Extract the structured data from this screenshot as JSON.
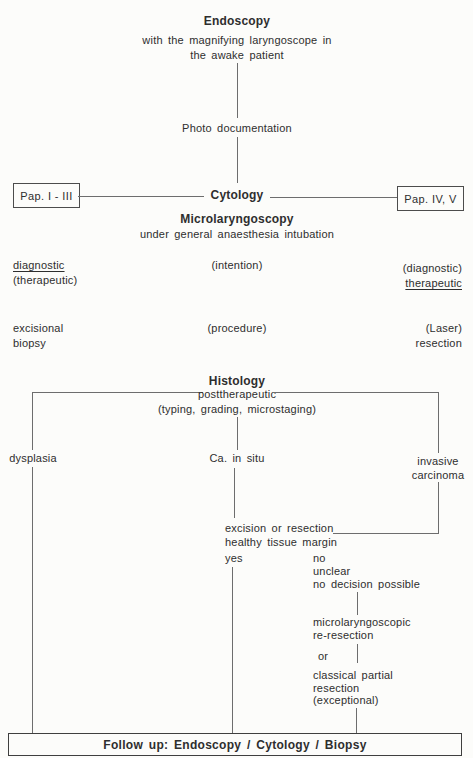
{
  "top": {
    "title": "Endoscopy",
    "subtitle1": "with the magnifying laryngoscope in",
    "subtitle2": "the awake patient",
    "photo_label": "Photo documentation"
  },
  "cytology": {
    "label": "Cytology",
    "left_box": "Pap. I - III",
    "right_box": "Pap. IV, V"
  },
  "microlaryngoscopy": {
    "title": "Microlaryngoscopy",
    "subtitle": "under general anaesthesia intubation"
  },
  "intention_row": {
    "left_line1": "diagnostic",
    "left_line2": "(therapeutic)",
    "center": "(intention)",
    "right_line1": "(diagnostic)",
    "right_line2": "therapeutic"
  },
  "procedure_row": {
    "left_line1": "excisional",
    "left_line2": "biopsy",
    "center": "(procedure)",
    "right_line1": "(Laser)",
    "right_line2": "resection"
  },
  "histology": {
    "title": "Histology",
    "line1": "posttherapeutic",
    "line2": "(typing, grading, microstaging)"
  },
  "branches": {
    "left": "dysplasia",
    "center": "Ca. in situ",
    "right_line1": "invasive",
    "right_line2": "carcinoma"
  },
  "decision": {
    "line1": "excision or resection",
    "line2": "healthy tissue margin",
    "yes": "yes",
    "no_line1": "no",
    "no_line2": "unclear",
    "no_line3": "no decision possible"
  },
  "reresection": {
    "line1": "microlaryngoscopic",
    "line2": "re-resection",
    "or": "or",
    "alt_line1": "classical partial",
    "alt_line2": "resection",
    "alt_line3": "(exceptional)"
  },
  "followup": {
    "label": "Follow up: Endoscopy / Cytology / Biopsy"
  },
  "colors": {
    "ink": "#2e2e2e",
    "line": "#6d6d6d",
    "paper": "#fcfcfa"
  }
}
